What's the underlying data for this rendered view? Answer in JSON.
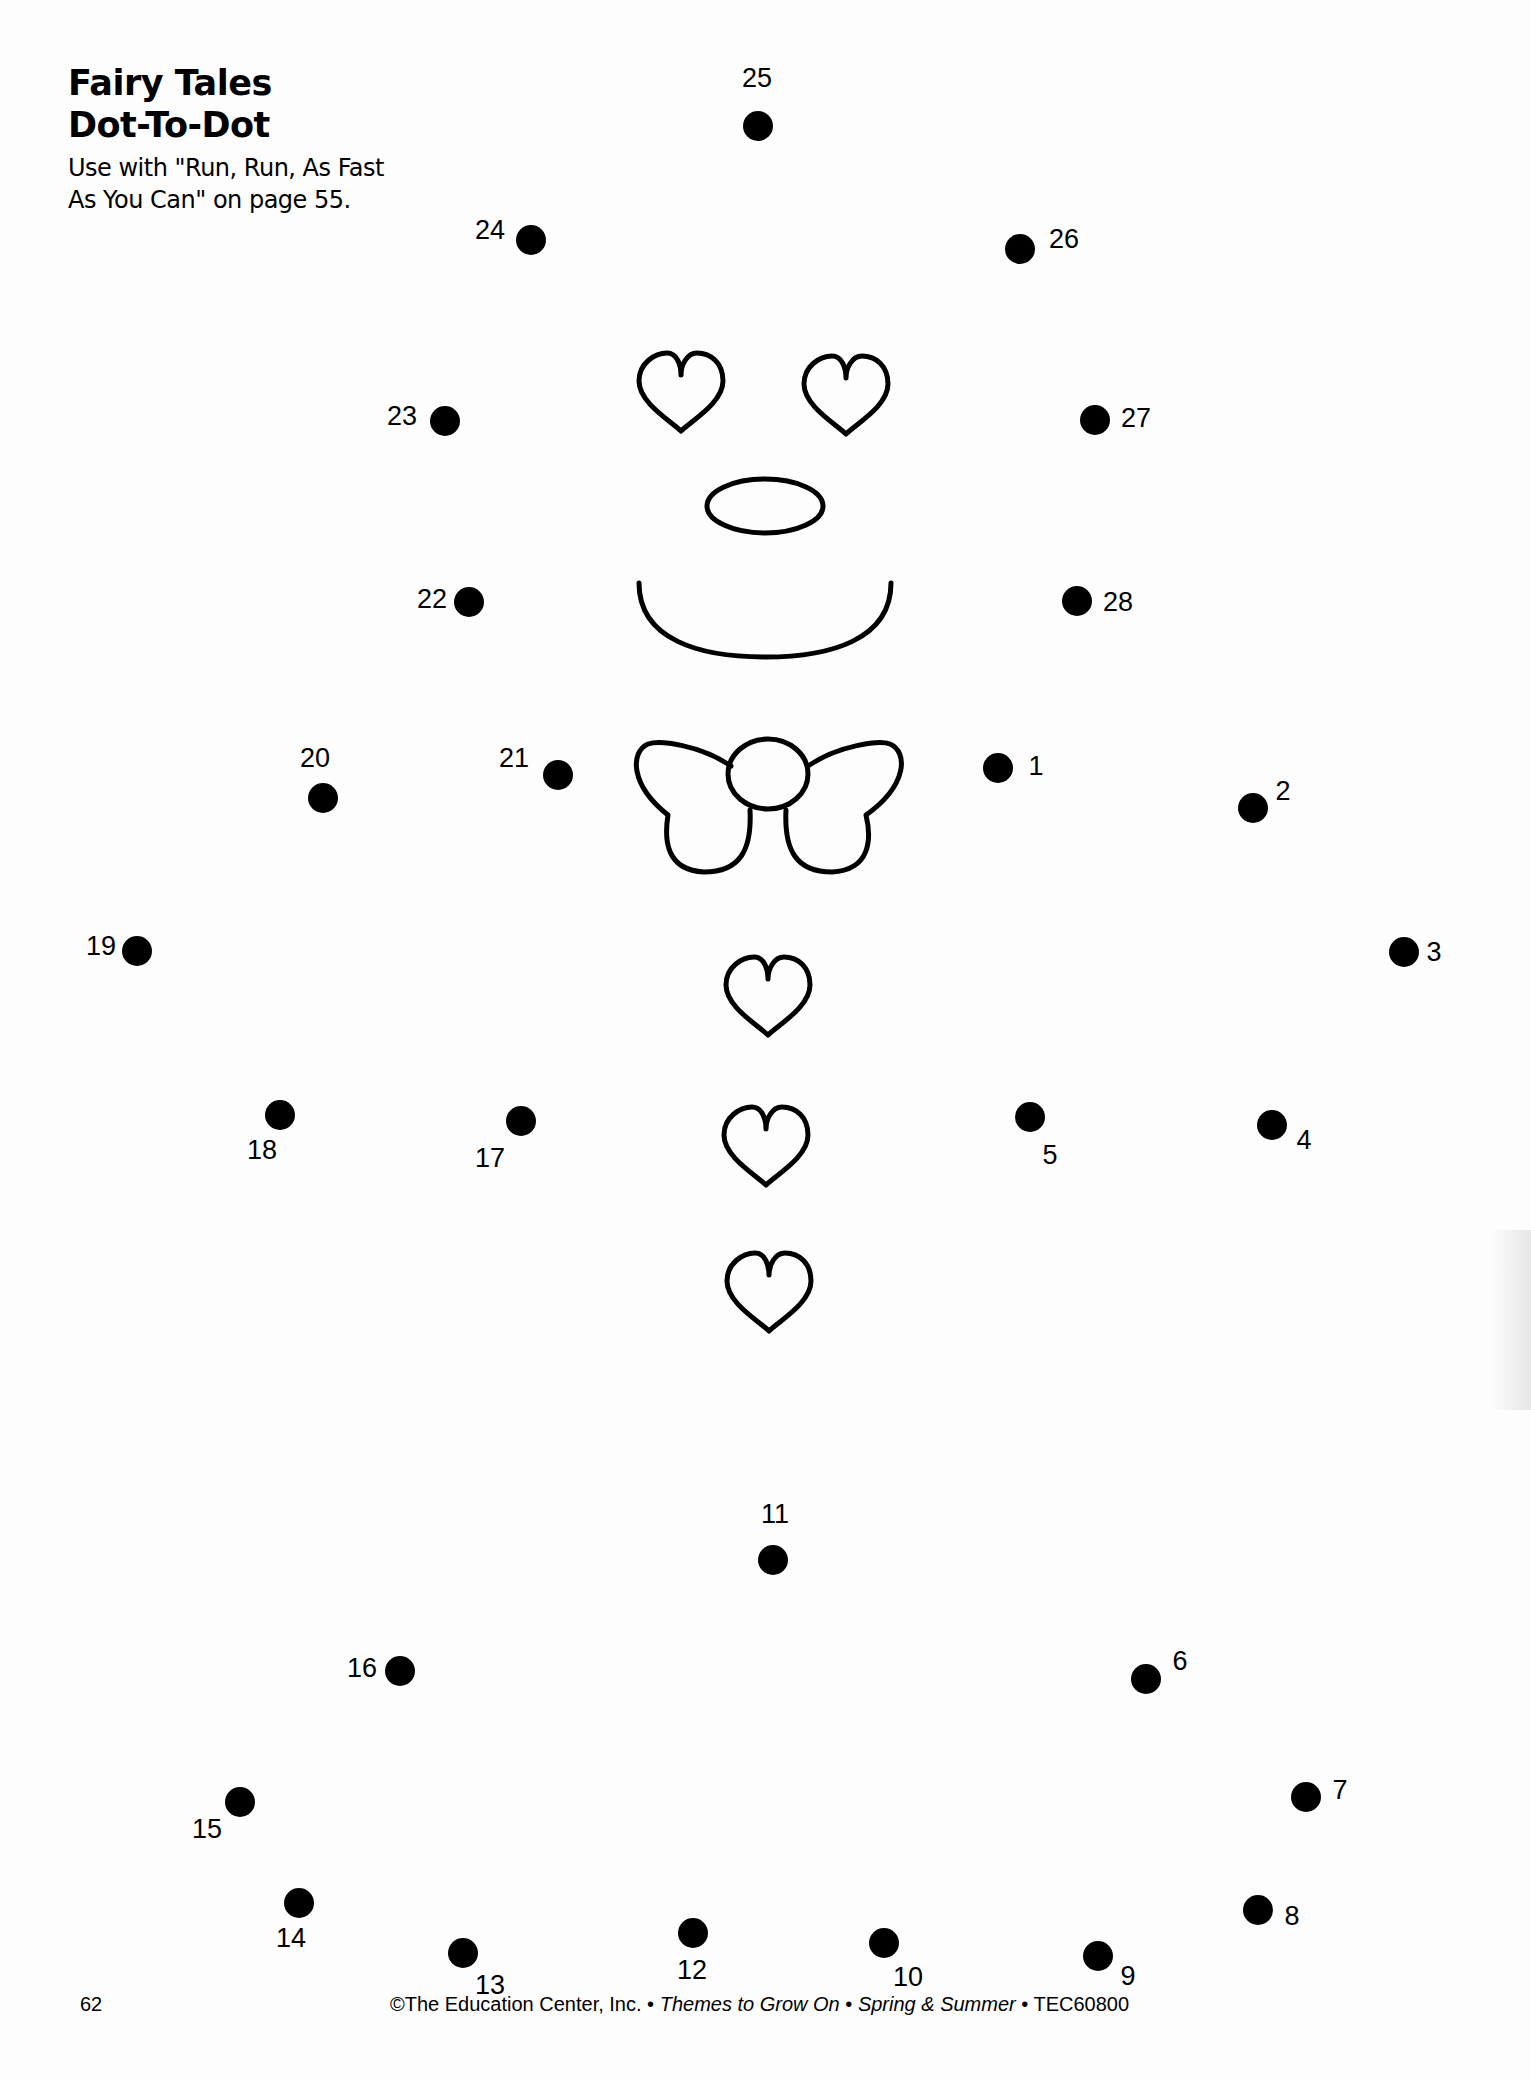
{
  "header": {
    "title_line1": "Fairy Tales",
    "title_line2": "Dot-To-Dot",
    "subtitle_line1": "Use with \"Run, Run, As Fast",
    "subtitle_line2": "As You Can\" on page 55."
  },
  "dots": [
    {
      "n": "1",
      "x": 998,
      "y": 768,
      "lx": 1036,
      "ly": 766
    },
    {
      "n": "2",
      "x": 1253,
      "y": 808,
      "lx": 1283,
      "ly": 791
    },
    {
      "n": "3",
      "x": 1404,
      "y": 952,
      "lx": 1434,
      "ly": 952
    },
    {
      "n": "4",
      "x": 1272,
      "y": 1125,
      "lx": 1304,
      "ly": 1140
    },
    {
      "n": "5",
      "x": 1030,
      "y": 1117,
      "lx": 1050,
      "ly": 1155
    },
    {
      "n": "6",
      "x": 1146,
      "y": 1679,
      "lx": 1180,
      "ly": 1661
    },
    {
      "n": "7",
      "x": 1306,
      "y": 1797,
      "lx": 1340,
      "ly": 1790
    },
    {
      "n": "8",
      "x": 1258,
      "y": 1910,
      "lx": 1292,
      "ly": 1916
    },
    {
      "n": "9",
      "x": 1098,
      "y": 1956,
      "lx": 1128,
      "ly": 1976
    },
    {
      "n": "10",
      "x": 884,
      "y": 1943,
      "lx": 908,
      "ly": 1977
    },
    {
      "n": "11",
      "x": 773,
      "y": 1560,
      "lx": 775,
      "ly": 1514
    },
    {
      "n": "12",
      "x": 693,
      "y": 1933,
      "lx": 692,
      "ly": 1970
    },
    {
      "n": "13",
      "x": 463,
      "y": 1953,
      "lx": 490,
      "ly": 1985
    },
    {
      "n": "14",
      "x": 299,
      "y": 1903,
      "lx": 291,
      "ly": 1938
    },
    {
      "n": "15",
      "x": 240,
      "y": 1802,
      "lx": 207,
      "ly": 1829
    },
    {
      "n": "16",
      "x": 400,
      "y": 1671,
      "lx": 362,
      "ly": 1668
    },
    {
      "n": "17",
      "x": 521,
      "y": 1121,
      "lx": 490,
      "ly": 1158
    },
    {
      "n": "18",
      "x": 280,
      "y": 1115,
      "lx": 262,
      "ly": 1150
    },
    {
      "n": "19",
      "x": 137,
      "y": 951,
      "lx": 101,
      "ly": 946
    },
    {
      "n": "20",
      "x": 323,
      "y": 798,
      "lx": 315,
      "ly": 758
    },
    {
      "n": "21",
      "x": 558,
      "y": 775,
      "lx": 514,
      "ly": 758
    },
    {
      "n": "22",
      "x": 469,
      "y": 602,
      "lx": 432,
      "ly": 599
    },
    {
      "n": "23",
      "x": 445,
      "y": 421,
      "lx": 402,
      "ly": 416
    },
    {
      "n": "24",
      "x": 531,
      "y": 240,
      "lx": 490,
      "ly": 230
    },
    {
      "n": "25",
      "x": 758,
      "y": 126,
      "lx": 757,
      "ly": 78
    },
    {
      "n": "26",
      "x": 1020,
      "y": 249,
      "lx": 1064,
      "ly": 239
    },
    {
      "n": "27",
      "x": 1095,
      "y": 420,
      "lx": 1136,
      "ly": 418
    },
    {
      "n": "28",
      "x": 1077,
      "y": 601,
      "lx": 1118,
      "ly": 602
    }
  ],
  "footer": {
    "page_number": "62",
    "copyright": "©The Education Center, Inc. •",
    "series": "Themes to Grow On",
    "sep1": "•",
    "season": "Spring & Summer",
    "code": "• TEC60800"
  }
}
